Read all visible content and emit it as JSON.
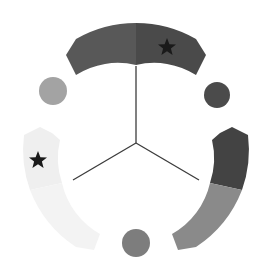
{
  "diagram": {
    "type": "three-sector-radial",
    "center": [
      136,
      143
    ],
    "arcs": [
      {
        "name": "top-arc",
        "segments": [
          {
            "name": "top-left-segment",
            "color": "#585858"
          },
          {
            "name": "top-right-segment",
            "color": "#4a4a4a",
            "marker": "star"
          }
        ]
      },
      {
        "name": "right-arc",
        "segments": [
          {
            "name": "right-upper-segment",
            "color": "#434343"
          },
          {
            "name": "right-lower-segment",
            "color": "#8a8a8a"
          }
        ]
      },
      {
        "name": "left-arc",
        "segments": [
          {
            "name": "left-upper-segment",
            "color": "#efefef",
            "marker": "star"
          },
          {
            "name": "left-lower-segment",
            "color": "#f3f3f3"
          }
        ]
      }
    ],
    "circles": [
      {
        "name": "left-circle",
        "color": "#a3a3a3"
      },
      {
        "name": "right-circle",
        "color": "#4b4b4b"
      },
      {
        "name": "bottom-circle",
        "color": "#7d7d7d"
      }
    ],
    "star_color": "#1a1a1a",
    "line_color": "#3c3c3c"
  }
}
